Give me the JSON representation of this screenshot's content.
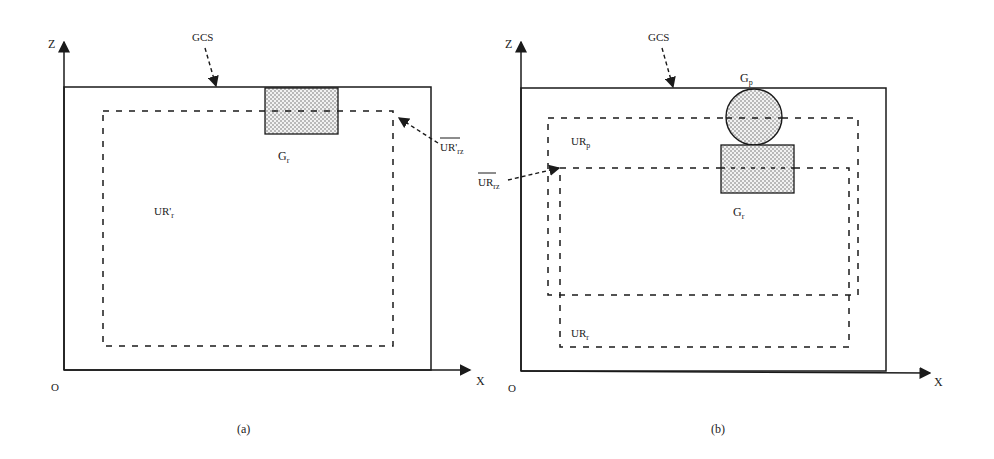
{
  "panels": [
    {
      "id": "a",
      "caption": "(a)",
      "axes": {
        "z_label": "Z",
        "x_label": "X",
        "origin_label": "O"
      },
      "gcs_label": "GCS",
      "ur_region_label": {
        "main": "UR'",
        "sub": "r"
      },
      "ur_rz_label": {
        "main": "UR'",
        "sub": "rz"
      },
      "gr_label": {
        "main": "G",
        "sub": "r"
      }
    },
    {
      "id": "b",
      "caption": "(b)",
      "axes": {
        "z_label": "Z",
        "x_label": "X",
        "origin_label": "O"
      },
      "gcs_label": "GCS",
      "gp_label": {
        "main": "G",
        "sub": "p"
      },
      "gr_label": {
        "main": "G",
        "sub": "r"
      },
      "ur_p_label": {
        "main": "UR",
        "sub": "p"
      },
      "ur_r_label": {
        "main": "UR",
        "sub": "r"
      },
      "ur_rz_label": {
        "main": "UR",
        "sub": "rz"
      }
    }
  ],
  "colors": {
    "stroke": "#1a1a1a",
    "fill_dots": "#555555",
    "fill_bg": "#eeeeee"
  }
}
